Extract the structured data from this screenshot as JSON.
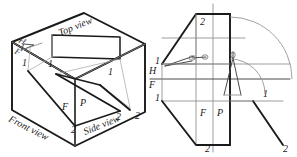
{
  "figure": {
    "background_color": "#ffffff",
    "ink_color": "#1a1a1a",
    "light_ink_color": "#8a8a8a",
    "mid_ink_color": "#5a5a5a"
  },
  "left_panel": {
    "name": "pictorial-glass-box",
    "description": "Open glass box in pictorial view with three principal planes",
    "plane_labels": {
      "top": "Top view",
      "front": "Front view",
      "side": "Side view"
    },
    "fold_line_labels": {
      "upper_left_h": "H",
      "upper_left_f": "F",
      "bottom_center_f": "F",
      "bottom_center_p": "P"
    },
    "point_labels": [
      {
        "id": "front-1",
        "text": "1",
        "x": 22,
        "y": 66
      },
      {
        "id": "top-1",
        "text": "1",
        "x": 48,
        "y": 67
      },
      {
        "id": "side-1",
        "text": "1",
        "x": 108,
        "y": 75
      },
      {
        "id": "front-2",
        "text": "2",
        "x": 71,
        "y": 129
      },
      {
        "id": "top-2",
        "text": "2",
        "x": 116,
        "y": 117
      },
      {
        "id": "side-2",
        "text": "2",
        "x": 135,
        "y": 116
      }
    ]
  },
  "right_panel": {
    "name": "unfolded-orthographic-views",
    "description": "Flattened three-view layout with compass arcs showing revolution",
    "fold_line_labels": {
      "left_h": "H",
      "left_f": "F",
      "center_f": "F",
      "center_p": "P"
    },
    "point_labels": [
      {
        "id": "top-2",
        "text": "2",
        "x": 203,
        "y": 21
      },
      {
        "id": "top-1",
        "text": "1",
        "x": 157,
        "y": 61
      },
      {
        "id": "front-1",
        "text": "1",
        "x": 157,
        "y": 98
      },
      {
        "id": "side-1",
        "text": "1",
        "x": 265,
        "y": 93
      },
      {
        "id": "front-2",
        "text": "2",
        "x": 208,
        "y": 142
      },
      {
        "id": "side-2",
        "text": "2",
        "x": 286,
        "y": 142
      }
    ],
    "compass_tools": [
      {
        "id": "compass-horizontal",
        "orientation": "horizontal",
        "x": 193,
        "y": 56
      },
      {
        "id": "compass-vertical",
        "orientation": "vertical",
        "x": 233,
        "y": 58
      }
    ],
    "arcs": [
      {
        "id": "inner-arc",
        "radius_px": 35
      },
      {
        "id": "outer-arc",
        "radius_px": 62
      }
    ]
  }
}
